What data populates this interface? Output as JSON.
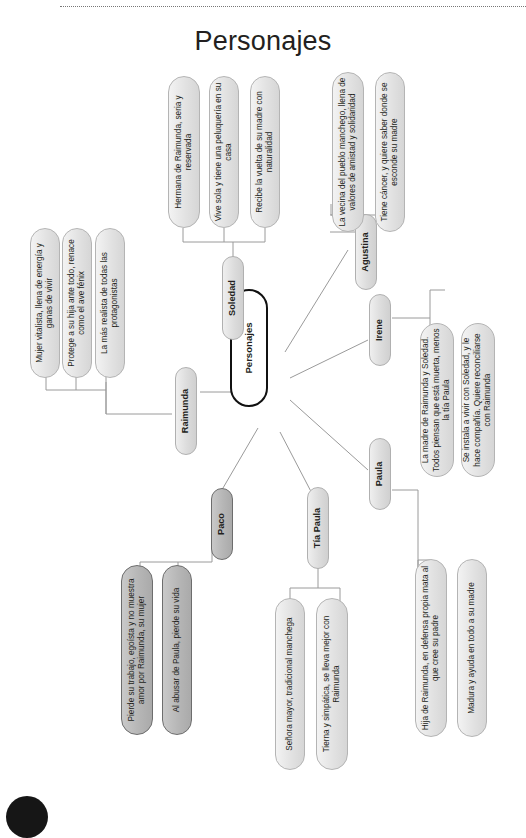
{
  "document": {
    "title": "Personajes",
    "type": "mind-map",
    "orientation": "rotated-90-ccw",
    "decorations": {
      "top_rule": "dotted-line",
      "corner_dot": "black-circle-bullet"
    }
  },
  "colors": {
    "page_background": "#ffffff",
    "node_fill": "#e2e2e2",
    "node_border": "#b9b9b9",
    "highlight_fill": "#b6b6b6",
    "highlight_border": "#6d6d6d",
    "root_border": "#111111",
    "root_fill": "#ffffff",
    "text": "#231f20",
    "connector": "#9a9a9a"
  },
  "root": {
    "label": "Personajes"
  },
  "branches": [
    {
      "id": "soledad",
      "label": "Soledad",
      "highlight": false,
      "leaves": [
        {
          "text": "Hermana de Raimunda, seria y reservada"
        },
        {
          "text": "Vive sola y tiene una peluquería en su casa"
        },
        {
          "text": "Recibe la vuelta de su madre con naturalidad"
        }
      ]
    },
    {
      "id": "agustina",
      "label": "Agustina",
      "highlight": false,
      "leaves": [
        {
          "text": "La vecina del pueblo manchego, llena de valores de amistad y solidaridad"
        },
        {
          "text": "Tiene cáncer, y quiere saber donde se esconde su madre"
        }
      ]
    },
    {
      "id": "raimunda",
      "label": "Raimunda",
      "highlight": false,
      "leaves": [
        {
          "text": "Mujer vitalista, llena de energía y ganas de vivir"
        },
        {
          "text": "Protege a su hija ante todo, renace como el ave fénix"
        },
        {
          "text": "La más realista de todas las protagonistas"
        }
      ]
    },
    {
      "id": "irene",
      "label": "Irene",
      "highlight": false,
      "leaves": [
        {
          "text": "La madre de Raimunda y Soledad. Todos piensan que está muerta, menos la tía Paula"
        },
        {
          "text": "Se instala a vivir con Soledad, y le hace compañía. Quiere reconciliarse con Raimunda"
        }
      ]
    },
    {
      "id": "paula",
      "label": "Paula",
      "highlight": false,
      "leaves": [
        {
          "text": "Hija de Raimunda, en defensa propia mata al que cree su padre"
        },
        {
          "text": "Madura y ayuda en todo a su madre"
        }
      ]
    },
    {
      "id": "tia-paula",
      "label": "Tía Paula",
      "highlight": false,
      "leaves": [
        {
          "text": "Señora mayor, tradicional manchega"
        },
        {
          "text": "Tierna y simpática, se lleva mejor con Raimunda"
        }
      ]
    },
    {
      "id": "paco",
      "label": "Paco",
      "highlight": true,
      "leaves": [
        {
          "text": "Pierde su trabajo, egoísta y no muestra amor por Raimunda, su mujer"
        },
        {
          "text": "Al abusar de Paula, pierde su vida"
        }
      ]
    }
  ]
}
